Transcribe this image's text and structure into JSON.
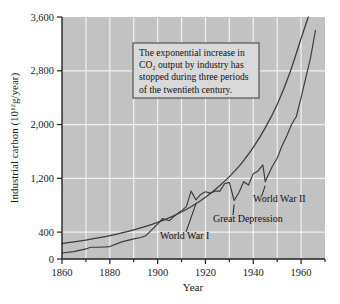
{
  "chart_data": {
    "type": "line",
    "title": "",
    "xlabel": "Year",
    "ylabel": "Industrial carbon (10",
    "ylabel_exponent": "12",
    "ylabel_tail": "g/year)",
    "xlim": [
      1860,
      1970
    ],
    "ylim": [
      0,
      3600
    ],
    "grid": true,
    "legend_position": "none",
    "x_ticks": [
      1860,
      1880,
      1900,
      1920,
      1940,
      1960
    ],
    "x_tick_labels": [
      "1860",
      "1880",
      "1900",
      "1920",
      "1940",
      "1960"
    ],
    "x_minor_ticks": [
      1870,
      1890,
      1910,
      1930,
      1950,
      1970
    ],
    "y_ticks": [
      0,
      400,
      1200,
      2000,
      2800,
      3600
    ],
    "y_tick_labels": [
      "0",
      "400",
      "1,200",
      "2,000",
      "2,800",
      "3,600"
    ],
    "series": [
      {
        "name": "Exponential trend",
        "style": "smooth",
        "x": [
          1860,
          1865,
          1870,
          1875,
          1880,
          1885,
          1890,
          1895,
          1900,
          1905,
          1910,
          1915,
          1920,
          1925,
          1930,
          1935,
          1940,
          1945,
          1950,
          1955,
          1960,
          1963
        ],
        "values": [
          230,
          255,
          282,
          313,
          348,
          388,
          433,
          485,
          545,
          615,
          700,
          800,
          920,
          1060,
          1225,
          1420,
          1660,
          1950,
          2300,
          2740,
          3280,
          3600
        ]
      },
      {
        "name": "Industrial carbon output",
        "style": "jagged",
        "x": [
          1860,
          1865,
          1870,
          1872,
          1875,
          1878,
          1880,
          1885,
          1890,
          1893,
          1895,
          1900,
          1902,
          1905,
          1907,
          1910,
          1912,
          1914,
          1916,
          1918,
          1920,
          1922,
          1924,
          1926,
          1928,
          1930,
          1932,
          1934,
          1936,
          1938,
          1940,
          1942,
          1944,
          1945,
          1946,
          1948,
          1950,
          1952,
          1954,
          1956,
          1958,
          1960,
          1962,
          1964,
          1966
        ],
        "values": [
          90,
          110,
          150,
          175,
          175,
          180,
          185,
          255,
          300,
          320,
          345,
          520,
          600,
          570,
          640,
          720,
          780,
          1010,
          880,
          960,
          1000,
          980,
          1010,
          1010,
          1120,
          1140,
          870,
          990,
          1150,
          1100,
          1270,
          1310,
          1400,
          1150,
          1230,
          1380,
          1500,
          1680,
          1830,
          2000,
          2120,
          2400,
          2700,
          3000,
          3400
        ]
      }
    ],
    "annotations": [
      {
        "label": "World War I",
        "x": 1916,
        "y": 880
      },
      {
        "label": "Great Depression",
        "x": 1932,
        "y": 870
      },
      {
        "label": "World War II",
        "x": 1945,
        "y": 1150
      }
    ],
    "note_box": {
      "lines": [
        "The exponential increase in",
        "CO₂ output by industry has",
        "stopped during three periods",
        "of the twentieth century."
      ]
    },
    "colors": {
      "plot_background": "#c2c2c2",
      "gridline": "#f0f0f0",
      "axis": "#222222",
      "line": "#3b3b3b",
      "note_background": "#d9d9d9",
      "note_border": "#3a3a3a",
      "page_background": "#ffffff"
    }
  }
}
